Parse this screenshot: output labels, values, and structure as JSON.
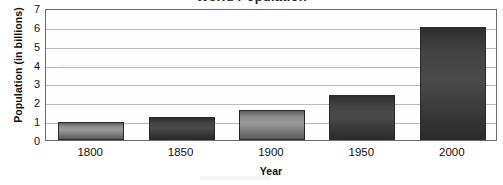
{
  "chart_data": {
    "type": "bar",
    "title": "World Population",
    "xlabel": "Year",
    "ylabel": "Population (in billions)",
    "categories": [
      "1800",
      "1850",
      "1900",
      "1950",
      "2000"
    ],
    "values": [
      0.95,
      1.2,
      1.6,
      2.4,
      6.0
    ],
    "ylim": [
      0,
      7
    ],
    "ytick_labels": [
      "0",
      "1",
      "2",
      "3",
      "4",
      "5",
      "6",
      "7"
    ],
    "ytick_values": [
      0,
      1,
      2,
      3,
      4,
      5,
      6,
      7
    ],
    "grid": "horizontal",
    "legend": "none",
    "bar_styles": [
      "light",
      "dark",
      "light",
      "dark",
      "dark"
    ],
    "colors": {
      "bar_light": "#8c8c8c",
      "bar_dark": "#3a3a3a",
      "bar_border": "#2a2a2a",
      "gridline": "#b9b9b9",
      "frame": "#6b6b6b",
      "text": "#111111",
      "background": "#ffffff"
    }
  }
}
